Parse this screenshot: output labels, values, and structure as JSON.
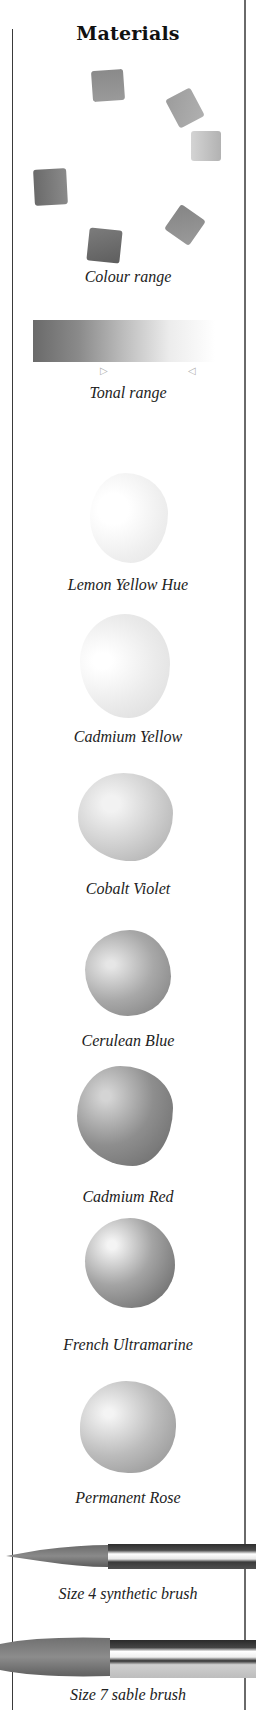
{
  "page": {
    "heading": "Materials"
  },
  "colour_wheel": {
    "caption": "Colour range",
    "swatches": [
      {
        "name": "top",
        "tone": "#8a8a8a"
      },
      {
        "name": "upper-right",
        "tone": "#a2a2a2"
      },
      {
        "name": "right",
        "tone": "#bcbcbc"
      },
      {
        "name": "left",
        "tone": "#707070"
      },
      {
        "name": "lower-right",
        "tone": "#8e8e8e"
      },
      {
        "name": "bottom",
        "tone": "#686868"
      }
    ]
  },
  "tonal_range": {
    "caption": "Tonal range",
    "markers": [
      "▷",
      "◁"
    ]
  },
  "paints": [
    {
      "label": "Lemon Yellow Hue",
      "tone": "#ececec"
    },
    {
      "label": "Cadmium Yellow",
      "tone": "#e2e2e2"
    },
    {
      "label": "Cobalt Violet",
      "tone": "#c4c4c4"
    },
    {
      "label": "Cerulean Blue",
      "tone": "#9c9c9c"
    },
    {
      "label": "Cadmium Red",
      "tone": "#8a8a8a"
    },
    {
      "label": "French Ultramarine",
      "tone": "#7a7a7a"
    },
    {
      "label": "Permanent Rose",
      "tone": "#a8a8a8"
    }
  ],
  "brushes": [
    {
      "label": "Size 4 synthetic brush"
    },
    {
      "label": "Size 7 sable brush"
    }
  ]
}
